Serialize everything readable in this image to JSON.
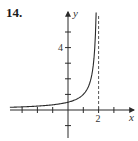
{
  "problem": {
    "number": "14."
  },
  "colors": {
    "axis": "#2a2a2a",
    "curve": "#2a2a2a",
    "asymptote": "#555555",
    "text": "#333333"
  },
  "chart_data": {
    "type": "line",
    "title": "",
    "xlabel": "x",
    "ylabel": "y",
    "function": "y = 1/(2 - x)",
    "xlim": [
      -3.8,
      4.3
    ],
    "ylim": [
      -1.8,
      6.2
    ],
    "x_ticks": [
      -3,
      -2,
      -1,
      1,
      2,
      3
    ],
    "x_tick_labels": [
      {
        "value": 2,
        "label": "2"
      }
    ],
    "y_ticks": [
      -1,
      1,
      2,
      3,
      4,
      5
    ],
    "y_tick_labels": [
      {
        "value": 4,
        "label": "4"
      }
    ],
    "vertical_asymptote": {
      "x": 2,
      "style": "dashed"
    },
    "horizontal_asymptote": {
      "y": 0
    },
    "series": [
      {
        "name": "curve",
        "x": [
          -3.7,
          -3,
          -2,
          -1,
          0,
          0.5,
          1,
          1.25,
          1.5,
          1.65,
          1.75,
          1.8,
          1.84
        ],
        "values": [
          0.18,
          0.2,
          0.25,
          0.33,
          0.5,
          0.67,
          1.0,
          1.33,
          2.0,
          2.86,
          4.0,
          5.0,
          6.2
        ]
      }
    ],
    "grid": false,
    "legend": "none"
  }
}
